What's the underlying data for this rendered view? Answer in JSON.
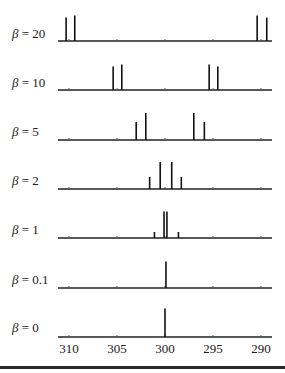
{
  "chart_data": {
    "type": "bar",
    "subtype": "stick-spectrum-stack",
    "title": "",
    "xlabel": "",
    "ylabel": "",
    "x_axis": {
      "reversed": true,
      "range": [
        311,
        289
      ],
      "ticks": [
        310,
        305,
        300,
        295,
        290
      ],
      "tick_labels": [
        "310",
        "305",
        "300",
        "295",
        "290"
      ]
    },
    "grid": false,
    "legend": null,
    "panels": [
      {
        "label": "β = 20",
        "beta_symbol": "β",
        "beta_value": "20",
        "peaks": [
          {
            "x": 310.3,
            "h": 0.78
          },
          {
            "x": 309.4,
            "h": 0.85
          },
          {
            "x": 290.4,
            "h": 0.85
          },
          {
            "x": 289.4,
            "h": 0.78
          }
        ]
      },
      {
        "label": "β = 10",
        "beta_symbol": "β",
        "beta_value": "10",
        "peaks": [
          {
            "x": 305.4,
            "h": 0.78
          },
          {
            "x": 304.5,
            "h": 0.85
          },
          {
            "x": 295.4,
            "h": 0.85
          },
          {
            "x": 294.5,
            "h": 0.78
          }
        ]
      },
      {
        "label": "β = 5",
        "beta_symbol": "β",
        "beta_value": "5",
        "peaks": [
          {
            "x": 303.0,
            "h": 0.6
          },
          {
            "x": 302.0,
            "h": 0.9
          },
          {
            "x": 297.0,
            "h": 0.9
          },
          {
            "x": 295.9,
            "h": 0.6
          }
        ]
      },
      {
        "label": "β = 2",
        "beta_symbol": "β",
        "beta_value": "2",
        "peaks": [
          {
            "x": 301.6,
            "h": 0.4
          },
          {
            "x": 300.5,
            "h": 0.9
          },
          {
            "x": 299.3,
            "h": 0.9
          },
          {
            "x": 298.3,
            "h": 0.4
          }
        ]
      },
      {
        "label": "β = 1",
        "beta_symbol": "β",
        "beta_value": "1",
        "peaks": [
          {
            "x": 301.1,
            "h": 0.2
          },
          {
            "x": 300.1,
            "h": 0.88
          },
          {
            "x": 299.8,
            "h": 0.88
          },
          {
            "x": 298.6,
            "h": 0.2
          }
        ]
      },
      {
        "label": "β = 0.1",
        "beta_symbol": "β",
        "beta_value": "0.1",
        "peaks": [
          {
            "x": 299.9,
            "h": 0.88
          }
        ]
      },
      {
        "label": "β = 0",
        "beta_symbol": "β",
        "beta_value": "0",
        "peaks": [
          {
            "x": 300.0,
            "h": 0.95
          }
        ]
      }
    ]
  },
  "layout_hints": {
    "baselines_y": [
      41,
      90,
      140,
      189,
      238,
      288,
      337
    ],
    "full_height_px": 30
  }
}
